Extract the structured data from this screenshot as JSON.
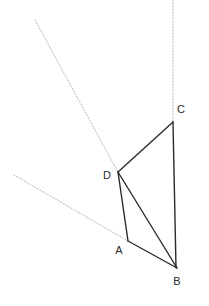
{
  "figure": {
    "width": 209,
    "height": 306,
    "background_color": "#ffffff",
    "solid_line_color": "#2b2b2b",
    "dotted_line_color": "#b0b0b0",
    "label_color": "#2b2b2b",
    "solid_line_width": 1.4,
    "dotted_line_width": 1.0
  },
  "vertices": {
    "A": {
      "name": "A",
      "label": "A",
      "x": 128,
      "y": 241,
      "label_x": 119,
      "label_y": 251
    },
    "B": {
      "name": "B",
      "label": "B",
      "x": 177,
      "y": 268,
      "label_x": 177,
      "label_y": 282
    },
    "C": {
      "name": "C",
      "label": "C",
      "x": 173,
      "y": 122,
      "label_x": 181,
      "label_y": 110
    },
    "D": {
      "name": "D",
      "label": "D",
      "x": 118,
      "y": 172,
      "label_x": 107,
      "label_y": 176
    }
  },
  "solid_edges": [
    {
      "name": "edge-DC",
      "from": "D",
      "to": "C",
      "x1": 118,
      "y1": 172,
      "x2": 173,
      "y2": 122
    },
    {
      "name": "edge-CB",
      "from": "C",
      "to": "B",
      "x1": 173,
      "y1": 122,
      "x2": 176,
      "y2": 268
    },
    {
      "name": "edge-DA",
      "from": "D",
      "to": "A",
      "x1": 118,
      "y1": 172,
      "x2": 128,
      "y2": 241
    },
    {
      "name": "edge-DB",
      "from": "D",
      "to": "B",
      "x1": 118,
      "y1": 172,
      "x2": 177,
      "y2": 268
    },
    {
      "name": "edge-AB",
      "from": "A",
      "to": "B",
      "x1": 128,
      "y1": 241,
      "x2": 177,
      "y2": 268
    }
  ],
  "dotted_lines": [
    {
      "name": "construction-line-to-D",
      "x1": 35,
      "y1": 20,
      "x2": 118,
      "y2": 172
    },
    {
      "name": "construction-line-to-A",
      "x1": 14,
      "y1": 175,
      "x2": 128,
      "y2": 241
    },
    {
      "name": "construction-line-vertical-to-C",
      "x1": 173,
      "y1": 0,
      "x2": 173,
      "y2": 122
    }
  ]
}
